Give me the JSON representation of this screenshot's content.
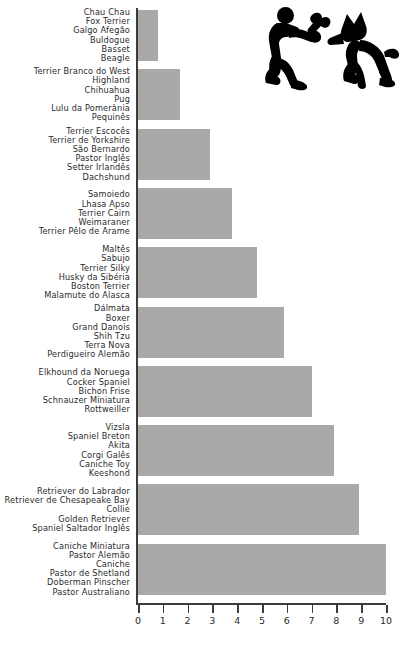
{
  "chart_data": {
    "type": "bar",
    "orientation": "horizontal",
    "title": "",
    "subtitle": "",
    "xlabel": "",
    "ylabel": "",
    "xlim": [
      0,
      10
    ],
    "ylim": null,
    "grid": false,
    "legend": null,
    "bar_color": "#a9a9a9",
    "axis_color": "#3c3c3c",
    "text_color": "#2b2b2b",
    "xticks": [
      0,
      1,
      2,
      3,
      4,
      5,
      6,
      7,
      8,
      9,
      10
    ],
    "xtick_labels": [
      "0",
      "1",
      "2",
      "3",
      "4",
      "5",
      "6",
      "7",
      "8",
      "9",
      "10"
    ],
    "categories": [
      "Chau Chau / Fox Terrier / Galgo Afegão / Buldogue / Basset / Beagle",
      "Terrier Branco do West Highland / Chihuahua / Pug / Lulu da Pomerânia / Pequinês",
      "Terrier Escocês / Terrier de Yorkshire / São Bernardo / Pastor Inglês / Setter Irlandês / Dachshund",
      "Samoiedo / Lhasa Apso / Terrier Cairn / Weimaraner / Terrier Pêlo de Arame",
      "Maltês / Sabujo / Terrier Silky / Husky da Sibéria / Boston Terrier / Malamute do Alasca",
      "Dálmata / Boxer / Grand Danois / Shih Tzu / Terra Nova / Perdigueiro Alemão",
      "Elkhound da Noruega / Cocker Spaniel / Bichon Frise / Schnauzer Miniatura / Rottweiller",
      "Vizsla / Spaniel Breton / Akita / Corgi Galês / Caniche Toy / Keeshond",
      "Retriever do Labrador / Retriever de Chesapeake Bay / Collie / Golden Retriever / Spaniel Saltador Inglês",
      "Caniche Miniatura / Pastor Alemão / Caniche / Pastor de Shetland / Doberman Pinscher / Pastor Australiano"
    ],
    "values": [
      0.8,
      1.7,
      2.9,
      3.8,
      4.8,
      5.9,
      7.0,
      7.9,
      8.9,
      10.0
    ],
    "groups": [
      {
        "value": 0.8,
        "breeds": [
          "Chau Chau",
          "Fox Terrier",
          "Galgo Afegão",
          "Buldogue",
          "Basset",
          "Beagle"
        ]
      },
      {
        "value": 1.7,
        "breeds": [
          "Terrier Branco do West",
          "Highland",
          "Chihuahua",
          "Pug",
          "Lulu da Pomerânia",
          "Pequinês"
        ]
      },
      {
        "value": 2.9,
        "breeds": [
          "Terrier Escocês",
          "Terrier de Yorkshire",
          "São Bernardo",
          "Pastor Inglês",
          "Setter Irlandês",
          "Dachshund"
        ]
      },
      {
        "value": 3.8,
        "breeds": [
          "Samoiedo",
          "Lhasa Apso",
          "Terrier Cairn",
          "Weimaraner",
          "Terrier Pêlo de Arame"
        ]
      },
      {
        "value": 4.8,
        "breeds": [
          "Maltês",
          "Sabujo",
          "Terrier Silky",
          "Husky da Sibéria",
          "Boston Terrier",
          "Malamute do Alasca"
        ]
      },
      {
        "value": 5.9,
        "breeds": [
          "Dálmata",
          "Boxer",
          "Grand Danois",
          "Shih Tzu",
          "Terra Nova",
          "Perdigueiro Alemão"
        ]
      },
      {
        "value": 7.0,
        "breeds": [
          "Elkhound da Noruega",
          "Cocker Spaniel",
          "Bichon Frise",
          "Schnauzer Miniatura",
          "Rottweiller"
        ]
      },
      {
        "value": 7.9,
        "breeds": [
          "Vizsla",
          "Spaniel Breton",
          "Akita",
          "Corgi Galês",
          "Caniche Toy",
          "Keeshond"
        ]
      },
      {
        "value": 8.9,
        "breeds": [
          "Retriever do Labrador",
          "Retriever de Chesapeake Bay",
          "Collie",
          "Golden Retriever",
          "Spaniel Saltador Inglês"
        ]
      },
      {
        "value": 10.0,
        "breeds": [
          "Caniche Miniatura",
          "Pastor Alemão",
          "Caniche",
          "Pastor de Shetland",
          "Doberman Pinscher",
          "Pastor Australiano"
        ]
      }
    ],
    "decoration": {
      "icon": "person-kneeling-with-bone-and-dog-icon",
      "icon_color": "#000000"
    }
  }
}
